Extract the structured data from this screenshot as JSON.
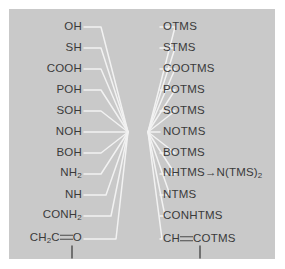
{
  "figure": {
    "background_color": "#c9c9c9",
    "text_color": "#3a3a3a",
    "line_color": "#f2f2f2"
  },
  "pairs": [
    {
      "reactant": "OH",
      "product": "OTMS"
    },
    {
      "reactant": "SH",
      "product": "STMS"
    },
    {
      "reactant": "COOH",
      "product": "COOTMS"
    },
    {
      "reactant": "POH",
      "product": "POTMS"
    },
    {
      "reactant": "SOH",
      "product": "SOTMS"
    },
    {
      "reactant": "NOH",
      "product": "NOTMS"
    },
    {
      "reactant": "BOH",
      "product": "BOTMS"
    },
    {
      "reactant": "NH2",
      "product": "NHTMS-N(TMS)2"
    },
    {
      "reactant": "NH",
      "product": "NTMS"
    },
    {
      "reactant": "CONH2",
      "product": "CONHTMS"
    },
    {
      "reactant": "CH2C=O",
      "product": "CH=COTMS"
    }
  ],
  "labels": {
    "r1_left": "OH",
    "r2_left": "SH",
    "r3_left": "COOH",
    "r4_left": "POH",
    "r5_left": "SOH",
    "r6_left": "NOH",
    "r7_left": "BOH",
    "r8_left_main": "NH",
    "r8_left_sub": "2",
    "r9_left": "NH",
    "r10_left_main": "CONH",
    "r10_left_sub": "2",
    "r11_left_a": "CH",
    "r11_left_sub": "2",
    "r11_left_b": "C",
    "r11_left_c": "O",
    "r1_right": "OTMS",
    "r2_right": "STMS",
    "r3_right": "COOTMS",
    "r4_right": "POTMS",
    "r5_right": "SOTMS",
    "r6_right": "NOTMS",
    "r7_right": "BOTMS",
    "r8_right_a": "NHTMS",
    "r8_right_arrow": "→",
    "r8_right_b": "N(TMS)",
    "r8_right_sub": "2",
    "r9_right": "NTMS",
    "r10_right": "CONHTMS",
    "r11_right_a": "CH",
    "r11_right_b": "COTMS"
  }
}
